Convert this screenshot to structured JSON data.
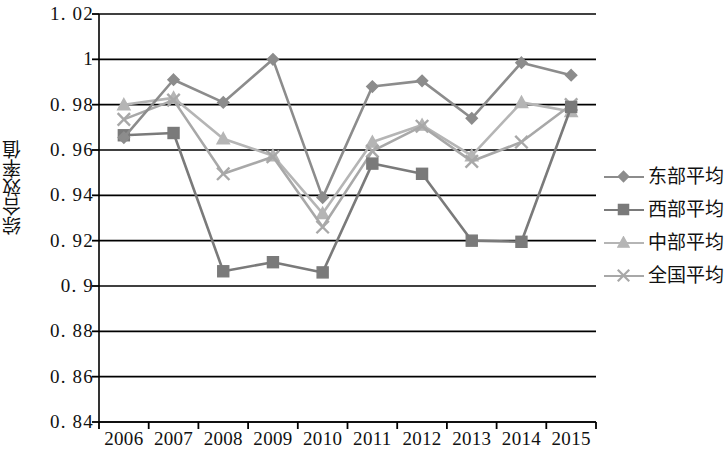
{
  "chart_data": {
    "type": "line",
    "title": "",
    "subtitle": "",
    "xlabel": "",
    "ylabel": "综合效率值",
    "categories": [
      "2006",
      "2007",
      "2008",
      "2009",
      "2010",
      "2011",
      "2012",
      "2013",
      "2014",
      "2015"
    ],
    "ylim": [
      0.84,
      1.02
    ],
    "ytick_labels": [
      "1. 02",
      "1",
      "0. 98",
      "0. 96",
      "0. 94",
      "0. 92",
      "0. 9",
      "0. 88",
      "0. 86",
      "0. 84"
    ],
    "ytick_values": [
      1.02,
      1.0,
      0.98,
      0.96,
      0.94,
      0.92,
      0.9,
      0.88,
      0.86,
      0.84
    ],
    "ystep": 0.02,
    "grid": true,
    "legend_position": "right",
    "series": [
      {
        "name": "东部平均",
        "marker": "diamond",
        "color": "#8c8c8c",
        "values": [
          0.9655,
          0.991,
          0.981,
          1.0,
          0.939,
          0.988,
          0.9905,
          0.974,
          0.9985,
          0.993
        ]
      },
      {
        "name": "西部平均",
        "marker": "square",
        "color": "#7a7a7a",
        "values": [
          0.9665,
          0.9675,
          0.9065,
          0.9105,
          0.906,
          0.954,
          0.9495,
          0.92,
          0.9195,
          0.979
        ]
      },
      {
        "name": "中部平均",
        "marker": "triangle",
        "color": "#b5b5b5",
        "values": [
          0.98,
          0.983,
          0.965,
          0.9575,
          0.932,
          0.9635,
          0.971,
          0.9575,
          0.981,
          0.977
        ]
      },
      {
        "name": "全国平均",
        "marker": "x",
        "color": "#a8a8a8",
        "values": [
          0.9735,
          0.982,
          0.9495,
          0.957,
          0.926,
          0.9595,
          0.9705,
          0.955,
          0.9635,
          0.98
        ]
      }
    ]
  },
  "legend": {
    "items": [
      {
        "label": "东部平均"
      },
      {
        "label": "西部平均"
      },
      {
        "label": "中部平均"
      },
      {
        "label": "全国平均"
      }
    ]
  },
  "axis": {
    "y_title": "综合效率值"
  },
  "colors": {
    "east": "#8c8c8c",
    "west": "#7a7a7a",
    "central": "#b5b5b5",
    "national": "#a8a8a8",
    "axis": "#000000",
    "grid": "#000000"
  }
}
